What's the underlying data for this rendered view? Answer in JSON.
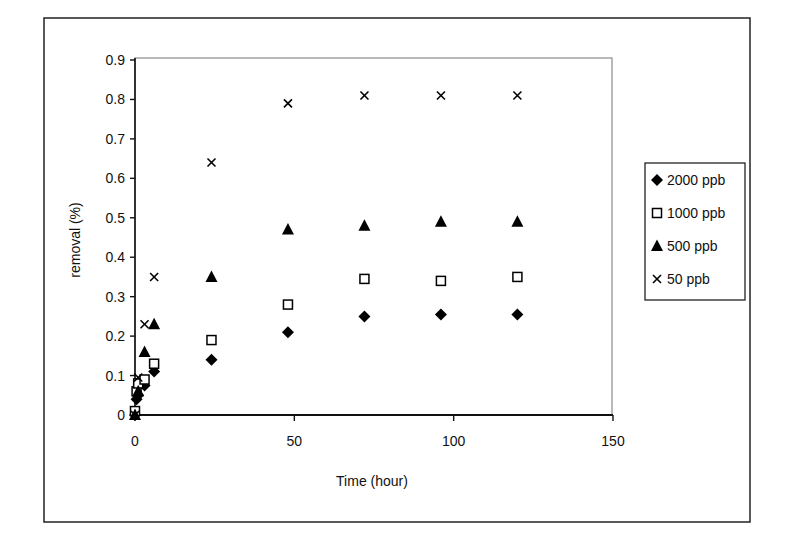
{
  "chart_data": {
    "type": "scatter",
    "title": "",
    "xlabel": "Time (hour)",
    "ylabel": "removal (%)",
    "xlim": [
      0,
      150
    ],
    "ylim": [
      0,
      0.9
    ],
    "xticks": [
      0,
      50,
      100,
      150
    ],
    "xtick_labels": [
      "0",
      "50",
      "100",
      "150"
    ],
    "yticks": [
      0,
      0.1,
      0.2,
      0.3,
      0.4,
      0.5,
      0.6,
      0.7,
      0.8,
      0.9
    ],
    "ytick_labels": [
      "0",
      "0.1",
      "0.2",
      "0.3",
      "0.4",
      "0.5",
      "0.6",
      "0.7",
      "0.8",
      "0.9"
    ],
    "grid": false,
    "legend_position": "right",
    "series": [
      {
        "name": "2000 ppb",
        "marker": "diamond-filled",
        "x": [
          0,
          0.5,
          1,
          3,
          6,
          24,
          48,
          72,
          96,
          120
        ],
        "y": [
          0.0,
          0.04,
          0.05,
          0.075,
          0.11,
          0.14,
          0.21,
          0.25,
          0.255,
          0.255
        ]
      },
      {
        "name": "1000 ppb",
        "marker": "square-open",
        "x": [
          0,
          0.5,
          1,
          3,
          6,
          24,
          48,
          72,
          96,
          120
        ],
        "y": [
          0.01,
          0.06,
          0.08,
          0.09,
          0.13,
          0.19,
          0.28,
          0.345,
          0.34,
          0.35
        ]
      },
      {
        "name": "500 ppb",
        "marker": "triangle-filled",
        "x": [
          0,
          1,
          3,
          6,
          24,
          48,
          72,
          96,
          120
        ],
        "y": [
          0.0,
          0.06,
          0.16,
          0.23,
          0.35,
          0.47,
          0.48,
          0.49,
          0.49
        ]
      },
      {
        "name": "50 ppb",
        "marker": "x",
        "x": [
          0,
          1,
          3,
          6,
          24,
          48,
          72,
          96,
          120
        ],
        "y": [
          0.0,
          0.095,
          0.23,
          0.35,
          0.64,
          0.79,
          0.81,
          0.81,
          0.81
        ]
      }
    ]
  },
  "legend": {
    "items": [
      {
        "label": "2000 ppb",
        "marker": "diamond-filled"
      },
      {
        "label": "1000 ppb",
        "marker": "square-open"
      },
      {
        "label": "500 ppb",
        "marker": "triangle-filled"
      },
      {
        "label": "50 ppb",
        "marker": "x"
      }
    ]
  },
  "colors": {
    "marker": "#000000",
    "axis": "#111111",
    "plot_border": "#8a8a8a",
    "frame": "#222222",
    "background": "#ffffff"
  }
}
